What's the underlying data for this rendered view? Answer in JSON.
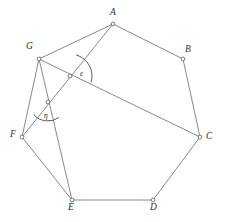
{
  "figure": {
    "type": "geometry-diagram",
    "background_color": "#ffffff",
    "line_color": "#6b6b6b",
    "label_color": "#2e2e2e",
    "vertex_fill": "#ffffff",
    "vertex_stroke": "#5a5a5a",
    "vertex_radius": 1.9,
    "width": 225,
    "height": 222
  },
  "vertices": [
    {
      "id": "A",
      "label": "A",
      "x": 113,
      "y": 24,
      "label_x": 110,
      "label_y": 8
    },
    {
      "id": "B",
      "label": "B",
      "x": 183,
      "y": 59,
      "label_x": 185,
      "label_y": 45
    },
    {
      "id": "C",
      "label": "C",
      "x": 200,
      "y": 137,
      "label_x": 206,
      "label_y": 132
    },
    {
      "id": "D",
      "label": "D",
      "x": 153,
      "y": 200,
      "label_x": 150,
      "label_y": 203
    },
    {
      "id": "E",
      "label": "E",
      "x": 72,
      "y": 200,
      "label_x": 68,
      "label_y": 203
    },
    {
      "id": "F",
      "label": "F",
      "x": 22,
      "y": 137,
      "label_x": 10,
      "label_y": 130
    },
    {
      "id": "G",
      "label": "G",
      "x": 39,
      "y": 59,
      "label_x": 26,
      "label_y": 42
    }
  ],
  "intersections": [
    {
      "id": "P1",
      "x": 70,
      "y": 76,
      "on_lines": [
        "A-F",
        "G-C"
      ]
    },
    {
      "id": "P2",
      "x": 48,
      "y": 102,
      "on_lines": [
        "A-F",
        "G-E"
      ]
    }
  ],
  "edges": [
    {
      "from": "A",
      "to": "B"
    },
    {
      "from": "B",
      "to": "C"
    },
    {
      "from": "C",
      "to": "D"
    },
    {
      "from": "D",
      "to": "E"
    },
    {
      "from": "E",
      "to": "F"
    },
    {
      "from": "F",
      "to": "G"
    },
    {
      "from": "G",
      "to": "A"
    }
  ],
  "diagonals": [
    {
      "from": "G",
      "to": "C"
    },
    {
      "from": "A",
      "to": "F"
    },
    {
      "from": "G",
      "to": "E"
    }
  ],
  "angles": [
    {
      "id": "epsilon",
      "label": "ε",
      "vertex_x": 70,
      "vertex_y": 76,
      "radius": 22,
      "start_deg": -74,
      "end_deg": 17,
      "label_x": 80,
      "label_y": 70
    },
    {
      "id": "eta",
      "label": "η",
      "vertex_x": 48,
      "vertex_y": 102,
      "radius": 19,
      "start_deg": 55,
      "end_deg": 138,
      "label_x": 44,
      "label_y": 112
    }
  ]
}
